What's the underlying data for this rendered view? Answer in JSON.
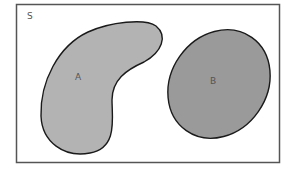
{
  "diagram": {
    "type": "venn",
    "universe": {
      "label": "S",
      "fill": "#ffffff",
      "stroke": "#555555"
    },
    "sets": [
      {
        "label": "A",
        "fill": "#b3b3b3",
        "stroke": "#1a1a1a",
        "shape": "kidney"
      },
      {
        "label": "B",
        "fill": "#9a9a9a",
        "stroke": "#1a1a1a",
        "shape": "ellipse"
      }
    ],
    "relationship": "disjoint"
  }
}
